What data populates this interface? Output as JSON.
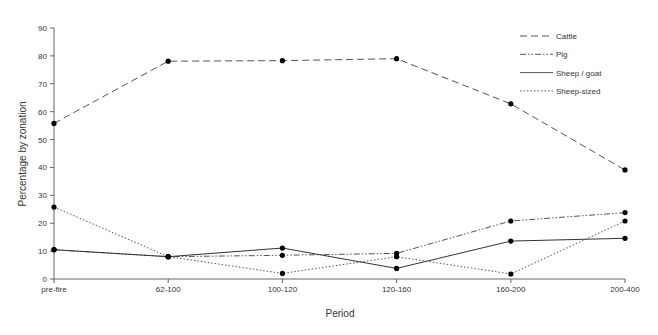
{
  "chart_data": {
    "type": "line",
    "title": "",
    "xlabel": "Period",
    "ylabel": "Percentage by zonation",
    "ylim": [
      0,
      90
    ],
    "yticks": [
      0,
      10,
      20,
      30,
      40,
      50,
      60,
      70,
      80,
      90
    ],
    "grid": false,
    "legend_position": "upper right",
    "categories": [
      "pre-fire",
      "62-100",
      "100-120",
      "120-160",
      "160-200",
      "200-400"
    ],
    "series": [
      {
        "name": "Cattle",
        "style": "dashed",
        "values": [
          55.8,
          78.1,
          78.3,
          79.0,
          62.8,
          39.1
        ]
      },
      {
        "name": "Pig",
        "style": "dash-dot-dot",
        "values": [
          10.5,
          8.0,
          8.5,
          9.2,
          20.8,
          23.8
        ]
      },
      {
        "name": "Sheep / goat",
        "style": "solid",
        "values": [
          10.5,
          8.0,
          11.1,
          3.8,
          13.6,
          14.6
        ]
      },
      {
        "name": "Sheep-sized",
        "style": "dotted",
        "values": [
          25.8,
          8.0,
          2.0,
          8.0,
          1.8,
          20.8
        ]
      }
    ]
  }
}
